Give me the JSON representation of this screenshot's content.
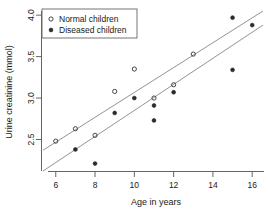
{
  "chart_data": {
    "type": "scatter",
    "title": "",
    "xlabel": "Age in years",
    "ylabel": "Urine creatinine (mmol)",
    "xlim": [
      5.3,
      16.6
    ],
    "ylim": [
      2.12,
      4.05
    ],
    "xticks": [
      6,
      8,
      10,
      12,
      14,
      16
    ],
    "xticklabels": [
      "6",
      "8",
      "10",
      "12",
      "14",
      "16"
    ],
    "yticks": [
      2.5,
      3.0,
      3.5,
      4.0
    ],
    "yticklabels": [
      "2.5",
      "3.0",
      "3.5",
      "4.0"
    ],
    "grid": false,
    "legend_position": "upper left",
    "series": [
      {
        "name": "Normal children",
        "marker": "open-circle",
        "color": "#333333",
        "points": [
          {
            "x": 6,
            "y": 2.48
          },
          {
            "x": 7,
            "y": 2.63
          },
          {
            "x": 8,
            "y": 2.55
          },
          {
            "x": 9,
            "y": 3.08
          },
          {
            "x": 10,
            "y": 3.35
          },
          {
            "x": 11,
            "y": 3.0
          },
          {
            "x": 12,
            "y": 3.16
          },
          {
            "x": 13,
            "y": 3.53
          }
        ]
      },
      {
        "name": "Diseased children",
        "marker": "filled-circle",
        "color": "#2b2b2b",
        "points": [
          {
            "x": 7,
            "y": 2.38
          },
          {
            "x": 8,
            "y": 2.21
          },
          {
            "x": 9,
            "y": 2.82
          },
          {
            "x": 10,
            "y": 3.0
          },
          {
            "x": 11,
            "y": 2.91
          },
          {
            "x": 11,
            "y": 2.73
          },
          {
            "x": 12,
            "y": 3.07
          },
          {
            "x": 15,
            "y": 3.97
          },
          {
            "x": 15,
            "y": 3.34
          },
          {
            "x": 16,
            "y": 3.88
          }
        ]
      }
    ],
    "fit_lines": [
      {
        "name": "normal-fit-line",
        "for_series": "Normal children",
        "x_start": 5.35,
        "y_start": 2.37,
        "x_end": 16.55,
        "y_end": 4.05,
        "color": "#777777"
      },
      {
        "name": "diseased-fit-line",
        "for_series": "Diseased children",
        "x_start": 5.35,
        "y_start": 2.12,
        "x_end": 16.55,
        "y_end": 3.88,
        "color": "#777777"
      }
    ]
  },
  "legend": {
    "entries": [
      {
        "label": "Normal children",
        "marker": "open-circle"
      },
      {
        "label": "Diseased children",
        "marker": "filled-circle"
      }
    ]
  },
  "axes": {
    "x_title": "Age in years",
    "y_title": "Urine creatinine (mmol)"
  }
}
